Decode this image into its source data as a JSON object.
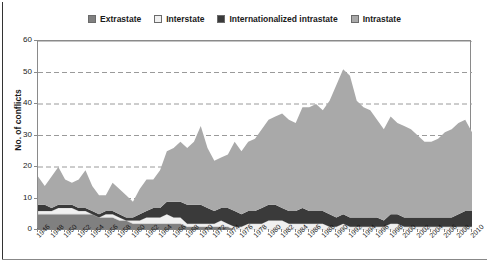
{
  "chart_data": {
    "type": "area",
    "stacked": true,
    "title": "",
    "xlabel": "",
    "ylabel": "No. of conflicts",
    "ylim": [
      0,
      60
    ],
    "yticks": [
      0,
      10,
      20,
      30,
      40,
      50,
      60
    ],
    "grid": "horizontal-dashed",
    "legend_position": "top-center",
    "xtick_step": 2,
    "x": [
      1946,
      1947,
      1948,
      1949,
      1950,
      1951,
      1952,
      1953,
      1954,
      1955,
      1956,
      1957,
      1958,
      1959,
      1960,
      1961,
      1962,
      1963,
      1964,
      1965,
      1966,
      1967,
      1968,
      1969,
      1970,
      1971,
      1972,
      1973,
      1974,
      1975,
      1976,
      1977,
      1978,
      1979,
      1980,
      1981,
      1982,
      1983,
      1984,
      1985,
      1986,
      1987,
      1988,
      1989,
      1990,
      1991,
      1992,
      1993,
      1994,
      1995,
      1996,
      1997,
      1998,
      1999,
      2000,
      2001,
      2002,
      2003,
      2004,
      2005,
      2006,
      2007,
      2008,
      2009,
      2010
    ],
    "xtick_labels": [
      "1946",
      "1948",
      "1950",
      "1952",
      "1954",
      "1956",
      "1958",
      "1960",
      "1962",
      "1964",
      "1966",
      "1968",
      "1970",
      "1972",
      "1974",
      "1976",
      "1978",
      "1980",
      "1982",
      "1984",
      "1986",
      "1988",
      "1990",
      "1992",
      "1994",
      "1996",
      "1998",
      "2000",
      "2002",
      "2004",
      "2006",
      "2008",
      "2010"
    ],
    "series": [
      {
        "name": "Extrastate",
        "color": "#808080",
        "values": [
          5,
          5,
          5,
          5,
          5,
          5,
          5,
          5,
          5,
          4,
          4,
          4,
          3,
          3,
          2,
          2,
          2,
          2,
          2,
          2,
          2,
          2,
          1,
          1,
          1,
          1,
          1,
          1,
          1,
          0,
          0,
          0,
          0,
          0,
          0,
          0,
          0,
          0,
          0,
          0,
          0,
          0,
          0,
          0,
          0,
          0,
          0,
          0,
          0,
          0,
          0,
          0,
          0,
          0,
          0,
          0,
          0,
          0,
          0,
          0,
          0,
          0,
          0,
          0,
          0
        ]
      },
      {
        "name": "Interstate",
        "color": "#f0f0f0",
        "values": [
          1,
          1,
          1,
          2,
          2,
          2,
          1,
          1,
          0,
          0,
          1,
          1,
          1,
          0,
          1,
          1,
          2,
          2,
          2,
          3,
          2,
          2,
          1,
          1,
          1,
          1,
          1,
          2,
          1,
          1,
          1,
          2,
          2,
          2,
          3,
          3,
          3,
          2,
          2,
          2,
          2,
          2,
          2,
          1,
          1,
          2,
          1,
          1,
          1,
          1,
          1,
          1,
          2,
          2,
          1,
          1,
          1,
          1,
          1,
          1,
          1,
          1,
          1,
          1,
          1
        ]
      },
      {
        "name": "Internationalized intrastate",
        "color": "#3a3a3a",
        "values": [
          2,
          2,
          1,
          1,
          1,
          1,
          1,
          1,
          1,
          1,
          1,
          1,
          1,
          1,
          1,
          2,
          2,
          3,
          3,
          4,
          5,
          5,
          6,
          6,
          6,
          5,
          4,
          4,
          5,
          5,
          4,
          4,
          4,
          5,
          5,
          5,
          4,
          4,
          4,
          5,
          4,
          4,
          4,
          4,
          3,
          3,
          3,
          3,
          3,
          3,
          3,
          2,
          3,
          3,
          3,
          3,
          3,
          3,
          3,
          3,
          3,
          3,
          4,
          5,
          5
        ]
      },
      {
        "name": "Intrastate",
        "color": "#a9a9a9",
        "values": [
          9,
          6,
          10,
          12,
          8,
          7,
          9,
          12,
          8,
          6,
          5,
          9,
          8,
          7,
          5,
          8,
          10,
          9,
          12,
          16,
          17,
          19,
          18,
          20,
          25,
          19,
          16,
          16,
          17,
          22,
          20,
          22,
          23,
          25,
          27,
          28,
          30,
          29,
          28,
          32,
          33,
          34,
          32,
          36,
          42,
          46,
          45,
          37,
          35,
          34,
          31,
          29,
          31,
          29,
          29,
          28,
          26,
          24,
          24,
          25,
          27,
          28,
          29,
          29,
          25
        ]
      }
    ],
    "totals_note": "Sum of four stacked bands per year",
    "peak": {
      "year": 1991,
      "value": 52
    }
  },
  "legend": {
    "items": [
      {
        "label": "Extrastate",
        "color": "#808080"
      },
      {
        "label": "Interstate",
        "color": "#f0f0f0"
      },
      {
        "label": "Internationalized intrastate",
        "color": "#3a3a3a"
      },
      {
        "label": "Intrastate",
        "color": "#a9a9a9"
      }
    ]
  },
  "axis": {
    "y_title": "No. of conflicts"
  }
}
